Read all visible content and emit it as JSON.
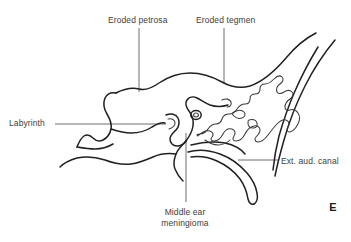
{
  "figure": {
    "panel_letter": "E",
    "background_color": "#ffffff",
    "line_color": "#231f20",
    "leader_color": "#6e6e6e",
    "text_color": "#3d3d3d"
  },
  "annotations": {
    "eroded_petrosa": {
      "label": "Eroded petrosa",
      "leader": "vertical-down"
    },
    "eroded_tegmen": {
      "label": "Eroded tegmen",
      "leader": "vertical-down"
    },
    "labyrinth": {
      "label": "Labyrinth",
      "leader": "horizontal-right"
    },
    "ext_aud_canal": {
      "label": "Ext. aud. canal",
      "leader": "horizontal-left"
    },
    "middle_ear_meningioma": {
      "label_line1": "Middle ear",
      "label_line2": "meningioma",
      "leader": "vertical-up"
    }
  }
}
